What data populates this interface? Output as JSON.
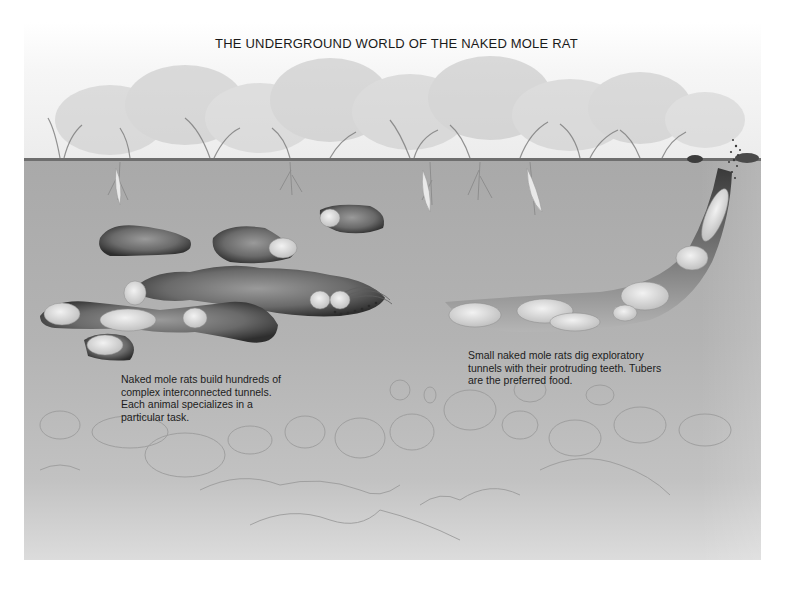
{
  "figure": {
    "title": "THE UNDERGROUND WORLD OF THE NAKED MOLE RAT",
    "captions": {
      "colony_tunnels": {
        "lines": [
          "Naked mole rats build hundreds of",
          "complex interconnected tunnels.",
          "Each animal specializes in a",
          "particular task."
        ]
      },
      "digging_tunnel": {
        "lines": [
          "Small naked mole rats dig exploratory",
          "tunnels with their protruding teeth. Tubers",
          "are the preferred food."
        ]
      }
    },
    "scene": {
      "layers": [
        "grassland-vegetation",
        "ground-surface",
        "soil-with-tunnels",
        "deep-soil-stones"
      ],
      "colors": {
        "sky": "#f4f4f4",
        "soil": "#adadad",
        "tunnel_dark": "#3c3c3c",
        "mole_rat": "#e6e6e6",
        "text": "#1a1a1a"
      }
    }
  }
}
